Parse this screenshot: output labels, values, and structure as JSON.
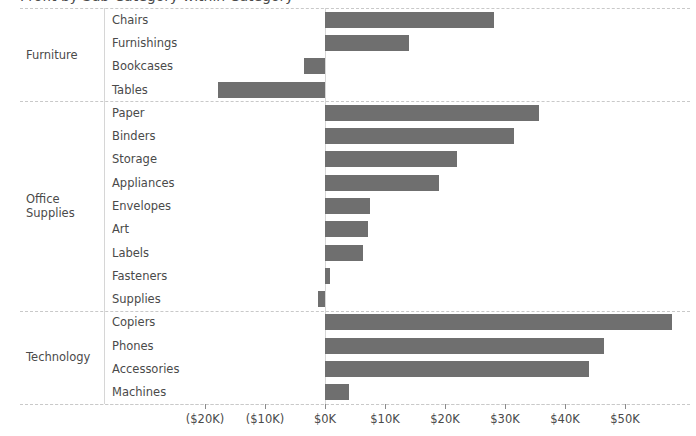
{
  "title": "Profit by Sub-Category within Category",
  "axis": {
    "ticks": [
      {
        "label": "($20K)",
        "value": -20000
      },
      {
        "label": "($10K)",
        "value": -10000
      },
      {
        "label": "$0K",
        "value": 0
      },
      {
        "label": "$10K",
        "value": 10000
      },
      {
        "label": "$20K",
        "value": 20000
      },
      {
        "label": "$30K",
        "value": 30000
      },
      {
        "label": "$40K",
        "value": 40000
      },
      {
        "label": "$50K",
        "value": 50000
      }
    ]
  },
  "colors": {
    "bar": "#6f6f6f",
    "text": "#4a4a4a",
    "gridline": "#c9c9c9",
    "axisline": "#d6d6d6"
  },
  "chart_data": {
    "type": "bar",
    "orientation": "horizontal",
    "title": "Profit by Sub-Category within Category",
    "xlabel": "",
    "ylabel": "",
    "xlim": [
      -23000,
      60000
    ],
    "grid": false,
    "legend": "none",
    "tick_labels": [
      "($20K)",
      "($10K)",
      "$0K",
      "$10K",
      "$20K",
      "$30K",
      "$40K",
      "$50K"
    ],
    "tick_values": [
      -20000,
      -10000,
      0,
      10000,
      20000,
      30000,
      40000,
      50000
    ],
    "groups": [
      {
        "name": "Furniture",
        "categories": [
          "Chairs",
          "Furnishings",
          "Bookcases",
          "Tables"
        ],
        "values": [
          28200,
          14000,
          -3500,
          -17900
        ]
      },
      {
        "name": "Office Supplies",
        "categories": [
          "Paper",
          "Binders",
          "Storage",
          "Appliances",
          "Envelopes",
          "Art",
          "Labels",
          "Fasteners",
          "Supplies"
        ],
        "values": [
          35700,
          31500,
          22000,
          19000,
          7500,
          7100,
          6300,
          900,
          -1200
        ]
      },
      {
        "name": "Technology",
        "categories": [
          "Copiers",
          "Phones",
          "Accessories",
          "Machines"
        ],
        "values": [
          57800,
          46500,
          44000,
          4000
        ]
      }
    ]
  }
}
